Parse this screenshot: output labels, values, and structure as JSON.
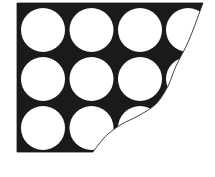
{
  "figure": {
    "canvas": {
      "width": 215,
      "height": 177
    },
    "background_color": "#ffffff",
    "fill_color": "#1a1a1a",
    "circle_color": "#ffffff",
    "outline_color": "#1a1a1a",
    "outline_width": 0.8,
    "region": {
      "name": "black-packing-region",
      "left": 17,
      "top": 3,
      "right": 203,
      "bottom": 152
    },
    "curve": {
      "name": "cut-curve",
      "description": "S-shaped curve from top-right corner sweeping down-left to the bottom edge",
      "start": {
        "x": 203,
        "y": 3
      },
      "end": {
        "x": 93,
        "y": 152
      },
      "control_points": [
        {
          "x": 189,
          "y": 40
        },
        {
          "x": 176,
          "y": 66
        },
        {
          "x": 168,
          "y": 86
        },
        {
          "x": 156,
          "y": 104
        },
        {
          "x": 138,
          "y": 116
        },
        {
          "x": 122,
          "y": 124
        },
        {
          "x": 108,
          "y": 134
        },
        {
          "x": 99,
          "y": 144
        }
      ]
    },
    "grid": {
      "name": "circle-grid",
      "rows": 3,
      "columns": 4,
      "radius": 22,
      "column_centers_x": [
        43,
        91.5,
        140,
        188
      ],
      "row_centers_y": [
        30,
        79,
        128
      ],
      "circles": [
        {
          "id": "circle-r1-c1",
          "cx": 43,
          "cy": 30,
          "r": 22,
          "clipped": false
        },
        {
          "id": "circle-r1-c2",
          "cx": 91.5,
          "cy": 30,
          "r": 22,
          "clipped": false
        },
        {
          "id": "circle-r1-c3",
          "cx": 140,
          "cy": 30,
          "r": 22,
          "clipped": false
        },
        {
          "id": "circle-r1-c4",
          "cx": 188,
          "cy": 30,
          "r": 22,
          "clipped": true
        },
        {
          "id": "circle-r2-c1",
          "cx": 43,
          "cy": 79,
          "r": 22,
          "clipped": false
        },
        {
          "id": "circle-r2-c2",
          "cx": 91.5,
          "cy": 79,
          "r": 22,
          "clipped": false
        },
        {
          "id": "circle-r2-c3",
          "cx": 140,
          "cy": 79,
          "r": 22,
          "clipped": false
        },
        {
          "id": "circle-r2-c4",
          "cx": 188,
          "cy": 79,
          "r": 22,
          "clipped": true
        },
        {
          "id": "circle-r3-c1",
          "cx": 43,
          "cy": 128,
          "r": 22,
          "clipped": false
        },
        {
          "id": "circle-r3-c2",
          "cx": 91.5,
          "cy": 128,
          "r": 22,
          "clipped": false
        },
        {
          "id": "circle-r3-c3",
          "cx": 140,
          "cy": 128,
          "r": 22,
          "clipped": true
        },
        {
          "id": "circle-r3-c4",
          "cx": 188,
          "cy": 128,
          "r": 22,
          "clipped": true
        }
      ]
    }
  }
}
